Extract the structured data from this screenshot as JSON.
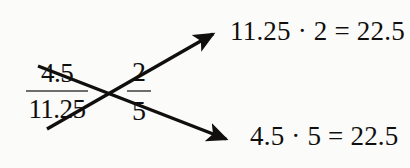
{
  "diagram": {
    "type": "cross-multiplication",
    "background_color": "#fbfbfa",
    "ink_color": "#100f0d",
    "rule_color": "#6e6e6b",
    "left_fraction": {
      "numerator": "4.5",
      "denominator": "11.25",
      "label": "left-fraction"
    },
    "right_fraction": {
      "numerator": "2",
      "denominator": "5",
      "label": "right-fraction"
    },
    "arrows": [
      {
        "name": "cross-arrow-up",
        "from": "left-denominator",
        "to": "top-equation",
        "direction": "up-right"
      },
      {
        "name": "cross-arrow-down",
        "from": "left-numerator",
        "to": "bottom-equation",
        "direction": "down-right"
      }
    ],
    "equations": {
      "top": "11.25 · 2 = 22.5",
      "bottom": "4.5 · 5 = 22.5"
    }
  }
}
